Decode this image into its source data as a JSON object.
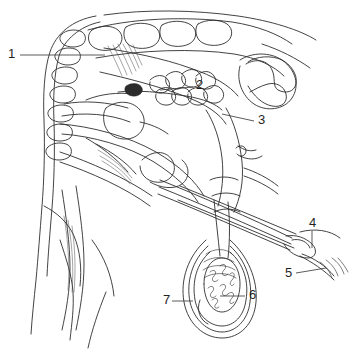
{
  "figure": {
    "background_color": "#ffffff",
    "ink_color": "#2e2e2e",
    "width": 356,
    "height": 352,
    "style": "line-drawing"
  },
  "labels": [
    {
      "id": "1",
      "text": "1",
      "text_x": 8,
      "text_y": 55,
      "leader": "M20,55 L105,55",
      "points_to": "vertebral-column"
    },
    {
      "id": "2",
      "text": "2",
      "text_x": 196,
      "text_y": 86,
      "leader": "M193,87 L160,90",
      "points_to": "lobulated-gland"
    },
    {
      "id": "3",
      "text": "3",
      "text_x": 258,
      "text_y": 121,
      "leader": "M254,121 L222,114",
      "points_to": "bladder-ampulla"
    },
    {
      "id": "4",
      "text": "4",
      "text_x": 309,
      "text_y": 224,
      "leader": "M312,231 L312,248",
      "points_to": "glans-penis"
    },
    {
      "id": "5",
      "text": "5",
      "text_x": 285,
      "text_y": 274,
      "leader": "M296,273 L326,268",
      "points_to": "preputial-opening"
    },
    {
      "id": "6",
      "text": "6",
      "text_x": 249,
      "text_y": 296,
      "leader": "M245,296 L220,296",
      "points_to": "testis-parenchyma"
    },
    {
      "id": "7",
      "text": "7",
      "text_x": 163,
      "text_y": 301,
      "leader": "M172,301 L193,301",
      "points_to": "scrotal-wall"
    }
  ],
  "paths": {
    "body_outline_front": "M96,16 C72,20 56,34 50,52 C44,70 43,96 44,120 C45,150 44,182 42,206 C40,232 38,258 36,280 C34,300 32,318 31,334",
    "body_outline_inner": "M100,22 C80,26 64,40 59,56 C54,74 53,98 54,122 C55,152 54,184 52,208 C50,232 48,256 47,276",
    "belly_curve": "M60,240 C66,258 72,276 73,292 C74,308 72,322 70,340",
    "thigh_curve": "M106,292 C98,312 92,330 88,348",
    "back_top": "M104,15 C146,9 196,10 238,16 C272,21 300,30 316,40",
    "rump_curve": "M262,44 C280,50 296,58 310,68",
    "vertebrae": [
      "M62,34 C66,30 74,29 80,31 C86,33 87,40 83,44 C78,48 68,48 63,44 C59,40 59,37 62,34",
      "M57,52 C61,48 69,47 75,49 C81,51 82,58 78,62 C73,66 63,66 58,62 C54,58 54,55 57,52",
      "M54,71 C58,67 66,66 72,68 C78,70 79,77 75,81 C70,85 60,85 55,81 C51,77 51,74 54,71",
      "M52,90 C56,86 64,85 70,87 C76,89 77,96 73,100 C68,104 58,104 53,100 C49,96 49,93 52,90",
      "M50,109 C54,105 62,104 68,106 C74,108 75,115 71,119 C66,123 56,123 51,119 C47,115 47,112 50,109",
      "M49,128 C53,124 61,123 67,125 C73,127 74,134 70,138 C65,142 55,142 50,138 C46,134 46,131 49,128",
      "M48,147 C52,143 60,142 66,144 C72,146 73,153 69,157 C64,161 54,161 49,157 C45,153 45,150 48,147"
    ],
    "sacral_vertebrae": [
      "M92,30 C100,25 112,25 118,30 C124,35 123,44 116,48 C108,52 96,51 91,45 C87,40 88,33 92,30",
      "M126,27 C134,22 148,22 155,27 C162,32 161,42 153,46 C145,50 132,49 127,43 C123,38 123,30 126,27",
      "M162,25 C170,20 184,20 191,25 C198,30 197,40 189,44 C181,48 168,47 163,41 C159,36 159,28 162,25",
      "M198,24 C206,19 220,19 227,24 C234,29 233,39 225,43 C217,47 204,46 199,40 C195,35 195,27 198,24"
    ],
    "sacrum_band_top": "M88,30 C130,18 186,16 232,22 C258,26 278,34 292,44",
    "sacrum_band_bottom": "M96,58 C140,50 194,48 234,54 C258,58 274,66 284,76",
    "pelvis_bone": "M246,64 C256,58 268,60 272,70 C276,78 272,86 278,90 C286,94 294,92 296,84 C298,74 290,64 282,60 C272,55 256,56 248,62",
    "pelvis_bone_lower": "M248,86 C254,96 262,104 272,106 C282,108 288,102 286,94 C284,86 276,82 268,84 C260,86 254,90 250,92",
    "pelvis_outline": "M240,60 C252,52 270,52 282,60 C296,70 300,86 292,98 C284,110 266,112 254,104 C242,96 236,80 240,66",
    "muscle_hatch": [
      "M108,46 C113,56 118,66 122,76",
      "M113,45 C118,55 123,65 127,75",
      "M118,44 C123,54 128,64 132,74",
      "M123,44 C128,53 132,62 136,71",
      "M128,44 C132,52 136,60 139,68",
      "M133,45 C136,52 139,59 142,65"
    ],
    "rectum_upper": "M104,48 C130,52 162,58 190,68 C214,76 230,86 238,96",
    "rectum_lower": "M100,72 C126,78 158,86 184,96 C206,104 220,114 226,124",
    "gland_lobes": [
      "M150,80 C156,74 164,74 168,80 C172,86 168,92 162,93 C154,94 148,88 150,82",
      "M166,76 C172,70 180,70 184,76 C188,82 184,88 178,89 C170,90 164,84 166,78",
      "M182,74 C188,68 196,68 200,74 C204,80 200,86 194,87 C186,88 180,82 182,76",
      "M196,76 C202,70 210,70 214,76 C218,82 214,88 208,89 C200,90 194,84 196,78",
      "M156,92 C162,86 170,86 174,92 C178,98 174,104 168,105 C160,106 154,100 156,94",
      "M172,92 C178,86 186,86 190,92 C194,98 190,104 184,105 C176,106 170,100 172,94",
      "M188,92 C194,86 202,86 206,92 C210,98 206,104 200,105 C192,106 186,100 188,94",
      "M204,90 C210,84 218,84 222,90 C226,96 222,102 216,103 C208,104 202,98 204,92"
    ],
    "seminal_dark": "M126,86 C132,82 140,83 142,88 C144,93 138,97 132,96 C126,95 123,90 126,86",
    "gland_duct": "M118,92 C136,90 162,92 186,96 C204,99 216,104 222,110",
    "bladder": "M106,108 C116,100 132,100 140,110 C148,120 144,134 132,138 C118,142 106,134 104,122 C103,115 104,111 106,108",
    "bladder_neck": "M140,122 C150,124 160,128 168,134",
    "prostate_curve": "M86,100 C100,94 118,92 134,94",
    "urethra_upper": "M64,104 C84,100 108,102 128,108",
    "urethra_lower": "M62,116 C84,112 110,114 130,122",
    "sigmoid_flexure": "M142,160 C152,150 166,150 172,160 C178,170 172,180 162,182 C150,184 140,176 140,166",
    "sigmoid_loop2": "M150,182 C160,188 174,190 182,184 C190,178 190,166 182,160",
    "colon_outer": "M60,124 C90,126 128,136 156,152 C180,166 196,182 204,196",
    "colon_inner": "M62,134 C92,136 128,146 154,162 C176,176 190,190 198,202",
    "ampulla_left": "M206,110 C214,122 220,140 222,158 C224,176 222,192 218,206",
    "ampulla_right": "M226,108 C234,122 240,142 242,162 C244,182 240,198 234,212",
    "vas_left": "M214,200 C216,218 218,238 220,256",
    "vas_right": "M228,202 C230,220 230,240 228,258",
    "cord_band1": "M210,180 C218,176 230,176 238,180",
    "cord_band2": "M212,196 C220,192 232,192 240,196",
    "cord_band3": "M214,212 C222,208 232,208 240,212",
    "pampiniform": [
      "M206,254 C214,248 226,248 232,254",
      "M204,262 C212,256 226,256 234,262",
      "M203,270 C211,264 227,264 235,270",
      "M204,278 C212,272 228,272 236,278"
    ],
    "scrotum_outer": "M206,240 C188,256 180,280 184,302 C188,324 204,338 222,338 C240,338 254,324 256,302 C258,280 248,256 230,240",
    "scrotum_mid": "M208,246 C192,260 186,282 190,302 C194,320 208,332 222,332 C236,332 248,320 250,302 C253,282 246,260 230,246",
    "scrotum_inner": "M210,252 C196,264 192,282 195,300 C198,316 210,326 222,326 C234,326 244,316 246,300 C249,282 244,264 230,252",
    "testis_outline": "M204,284 C204,268 212,258 222,258 C232,258 240,268 240,284 C240,300 232,312 222,312 C212,312 204,300 204,284",
    "seminiferous": [
      "M210,272 C214,268 218,272 214,276 C210,280 214,284 218,280",
      "M220,266 C224,262 228,266 224,270 C220,274 224,278 228,274",
      "M230,274 C234,270 236,276 232,280 C228,284 232,288 234,284",
      "M208,288 C212,284 216,288 212,292 C208,296 212,300 216,296",
      "M220,286 C224,282 228,286 224,290 C220,294 224,298 228,294",
      "M228,294 C232,290 236,294 232,298 C228,302 230,306 234,302",
      "M212,300 C216,296 220,300 216,304 C213,307 216,310 219,307"
    ],
    "epididymis_tail": "M200,300 C196,310 200,320 208,324",
    "penis_shaft_upper": "M160,180 C200,196 250,218 292,238",
    "penis_shaft_lower": "M158,194 C198,210 248,232 290,250",
    "penis_shaft_mid": "M159,187 C199,203 249,225 291,244",
    "glans": "M286,236 C296,234 306,238 312,244 C318,250 316,258 308,258 C298,258 288,252 284,244",
    "glans_inner": "M292,240 C300,238 308,242 310,248",
    "prepuce": "M300,232 C314,228 330,230 340,238",
    "prepuce_lower": "M302,254 C314,258 326,266 334,276",
    "preputial_hairs": [
      "M320,262 C326,266 330,272 332,278",
      "M326,260 C332,264 336,270 338,276",
      "M332,258 C338,262 342,268 344,274",
      "M338,258 C342,262 346,268 348,272"
    ],
    "preputial_base": "M300,256 C312,262 324,270 334,280",
    "retractor_muscle_upper": "M180,186 C220,202 262,220 296,234",
    "retractor_muscle_lower": "M178,200 C218,216 260,234 294,248",
    "ventral_body": "M44,206 C56,212 68,222 74,236 C80,250 82,268 80,286",
    "leg_outline_a": "M62,190 C66,216 70,244 70,268 C70,290 66,312 62,330",
    "leg_outline_b": "M76,186 C80,212 84,240 84,264 C84,288 80,310 76,330",
    "leg_muscle": [
      "M64,216 C68,240 70,266 68,290",
      "M68,220 C72,244 74,268 72,292",
      "M72,226 C75,248 76,270 74,292"
    ],
    "flank_line": "M92,240 C104,256 112,276 114,296",
    "nerve_branch_a": "M238,146 C244,150 250,152 256,150",
    "nerve_branch_b": "M240,156 C248,160 256,160 262,156",
    "nerve_node": "M236,148 C240,144 246,146 246,151 C246,156 240,158 237,154",
    "small_vessel_right": "M244,168 C256,172 268,178 278,186",
    "small_vessel_right2": "M244,176 C256,180 268,186 278,194",
    "crus_penis": "M96,144 C112,152 126,162 136,174",
    "crus_shade": [
      "M98,150 C112,158 124,168 132,178",
      "M100,156 C113,163 124,172 131,181",
      "M102,161 C114,168 124,176 130,184"
    ],
    "ischiocavernosus": "M86,138 C100,146 116,158 128,172",
    "pelvic_floor": "M60,152 C90,162 126,178 152,196",
    "pelvic_floor2": "M60,162 C90,172 126,188 150,206"
  }
}
